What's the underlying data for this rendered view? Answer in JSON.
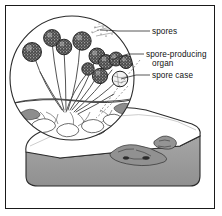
{
  "figure": {
    "style": "black-and-white line illustration with magnified circular inset"
  },
  "colors": {
    "frame_border": "#1a1a1a",
    "background": "#ffffff",
    "ink": "#222222",
    "slab_side": "#9a9a9a",
    "slab_top": "#ffffff",
    "mold_patch": "#8f8f8f",
    "sporangium_fill": "#3a3a3a"
  },
  "labels": [
    {
      "id": "spores",
      "text": "spores",
      "line": 1
    },
    {
      "id": "spore-producing-organ",
      "text": "spore-producing",
      "text2": "organ",
      "line": 2
    },
    {
      "id": "spore-case",
      "text": "spore case",
      "line": 1
    }
  ],
  "label_text": {
    "spores": "spores",
    "spore_producing_l1": "spore-producing",
    "spore_producing_l2": "organ",
    "spore_case": "spore case"
  },
  "scene": {
    "magnifier": {
      "shape": "circle",
      "cx": 72,
      "cy": 78,
      "r": 62
    },
    "slab": {
      "shape": "rounded-slab",
      "top_face": "white",
      "side_face": "grey"
    },
    "stalk_count": 11,
    "sporangia_count": 11,
    "mold_patch_count": 6,
    "spore_cloud": "dotted spray at upper right of magnifier"
  }
}
